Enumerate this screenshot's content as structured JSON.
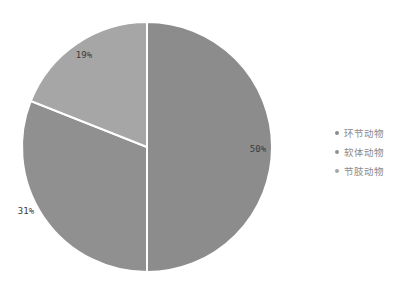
{
  "chart_data": {
    "type": "pie",
    "title": "",
    "categories": [
      "环节动物",
      "软体动物",
      "节肢动物"
    ],
    "values": [
      50,
      31,
      19
    ],
    "labels": [
      "50%",
      "31%",
      "19%"
    ],
    "colors": [
      "#8c8c8c",
      "#909090",
      "#a6a6a6"
    ],
    "start_angle_deg": 0,
    "direction": "clockwise",
    "legend_position": "right"
  },
  "legend": {
    "items": [
      {
        "label": "环节动物",
        "color": "#8c8c8c"
      },
      {
        "label": "软体动物",
        "color": "#909090"
      },
      {
        "label": "节肢动物",
        "color": "#a6a6a6"
      }
    ]
  }
}
